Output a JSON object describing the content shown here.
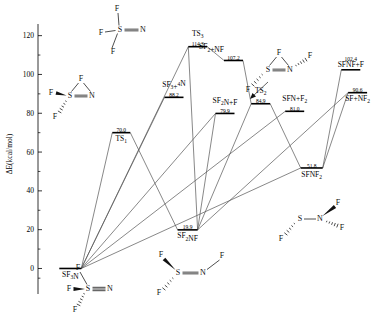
{
  "figure": {
    "type": "energy-profile-diagram",
    "axis": {
      "ylabel": "ΔE(kcal/mol)",
      "yticks": [
        0,
        20,
        40,
        60,
        80,
        100,
        120
      ],
      "ylim": [
        -8,
        126
      ],
      "xlim": [
        0,
        100
      ],
      "grid": false
    },
    "levels": [
      {
        "id": "sf3n",
        "label": "SF3N",
        "label_html": "SF<tspan class=\"sub\" dy=\"2\">3</tspan><tspan dy=\"-2\">N</tspan>",
        "value": 0.0,
        "value_text": "",
        "x": 9.5,
        "label_pos": "below",
        "value_pos": "none"
      },
      {
        "id": "ts1",
        "label": "TS1",
        "value": 70.0,
        "value_text": "70.0",
        "x": 24.5,
        "label_pos": "below",
        "value_pos": "above"
      },
      {
        "id": "sf2nf",
        "label": "SF2NF",
        "value": 19.9,
        "value_text": "19.9",
        "x": 44.0,
        "label_pos": "below",
        "value_pos": "above"
      },
      {
        "id": "ts3",
        "label": "TS3",
        "value": 114.3,
        "value_text": "114.3",
        "x": 47.0,
        "label_pos": "above",
        "value_pos": "below"
      },
      {
        "id": "sf3_4n",
        "label": "SF3+4N",
        "value": 88.2,
        "value_text": "88.2",
        "x": 40.0,
        "label_pos": "above",
        "value_pos": "below"
      },
      {
        "id": "sf2nf_gas",
        "label": "SF2+NF",
        "value": 107.2,
        "value_text": "107.2",
        "x": 57.5,
        "label_pos": "above",
        "value_pos": "below"
      },
      {
        "id": "sf2n_f",
        "label": "SF2N+F",
        "value": 79.9,
        "value_text": "79.9",
        "x": 55.0,
        "label_pos": "above",
        "value_pos": "below"
      },
      {
        "id": "ts2",
        "label": "TS2",
        "value": 84.9,
        "value_text": "84.9",
        "x": 65.5,
        "label_pos": "above",
        "value_pos": "below"
      },
      {
        "id": "sfn_f2",
        "label": "SFN+F2",
        "value": 81.0,
        "value_text": "81.0",
        "x": 75.5,
        "label_pos": "above",
        "value_pos": "below"
      },
      {
        "id": "sfnf2",
        "label": "SFNF2",
        "value": 51.8,
        "value_text": "51.8",
        "x": 80.5,
        "label_pos": "below",
        "value_pos": "above"
      },
      {
        "id": "sfnf_f",
        "label": "SFNF+F",
        "value": 102.4,
        "value_text": "102.4",
        "x": 92.0,
        "label_pos": "above",
        "value_pos": "above"
      },
      {
        "id": "sf_nf2",
        "label": "SF+NF2",
        "value": 90.6,
        "value_text": "90.6",
        "x": 94.0,
        "label_pos": "below",
        "value_pos": "above"
      }
    ],
    "level_label_text": {
      "sf3n": "SF3N",
      "ts1": "TS1",
      "sf2nf": "SF2NF",
      "ts3": "TS3",
      "sf3_4n": "SF3+4N",
      "sf2nf_gas": "SF2+NF",
      "sf2n_f": "SF2N+F",
      "ts2": "TS2",
      "sfn_f2": "SFN+F2",
      "sfnf2": "SFNF2",
      "sfnf_f": "SFNF+F",
      "sf_nf2": "SF+NF2"
    },
    "connections": [
      {
        "from": "sf3n",
        "to": "ts1"
      },
      {
        "from": "sf3n",
        "to": "ts3"
      },
      {
        "from": "sf3n",
        "to": "sf3_4n"
      },
      {
        "from": "sf3n",
        "to": "sf2n_f"
      },
      {
        "from": "sf3n",
        "to": "sfn_f2"
      },
      {
        "from": "sf3n",
        "to": "sfnf2"
      },
      {
        "from": "ts1",
        "to": "sf2nf"
      },
      {
        "from": "sf2nf",
        "to": "ts3"
      },
      {
        "from": "sf2nf",
        "to": "sf2n_f"
      },
      {
        "from": "sf2nf",
        "to": "ts2"
      },
      {
        "from": "sf2nf",
        "to": "sf_nf2"
      },
      {
        "from": "ts3",
        "to": "sf2nf_gas"
      },
      {
        "from": "sf2nf_gas",
        "to": "ts2"
      },
      {
        "from": "ts2",
        "to": "sfnf2"
      },
      {
        "from": "sfnf2",
        "to": "sfnf_f"
      },
      {
        "from": "sfnf2",
        "to": "sf_nf2"
      }
    ],
    "structures": [
      {
        "id": "struct-sf3n",
        "caption": "SF3N trigonal",
        "atoms": [
          "F",
          "F",
          "F",
          "S",
          "N"
        ],
        "bond": "triple"
      },
      {
        "id": "struct-ts1",
        "caption": "TS1 cyclic",
        "atoms": [
          "F",
          "F",
          "F",
          "S",
          "N"
        ],
        "bond": "double"
      },
      {
        "id": "struct-sf3n-top",
        "caption": "SF3N top",
        "atoms": [
          "F",
          "F",
          "F",
          "S",
          "N"
        ],
        "bond": "double"
      },
      {
        "id": "struct-sf2nf",
        "caption": "SF2NF",
        "atoms": [
          "F",
          "F",
          "F",
          "S",
          "N"
        ],
        "bond": "double"
      },
      {
        "id": "struct-ts2",
        "caption": "TS2 cyclic",
        "atoms": [
          "F",
          "F",
          "F",
          "S",
          "N"
        ],
        "bond": "double"
      },
      {
        "id": "struct-sfnf2",
        "caption": "SFNF2",
        "atoms": [
          "F",
          "F",
          "F",
          "S",
          "N"
        ],
        "bond": "single"
      }
    ],
    "colors": {
      "line": "#555555",
      "level": "#000000",
      "axis": "#000000",
      "text": "#000000"
    }
  }
}
